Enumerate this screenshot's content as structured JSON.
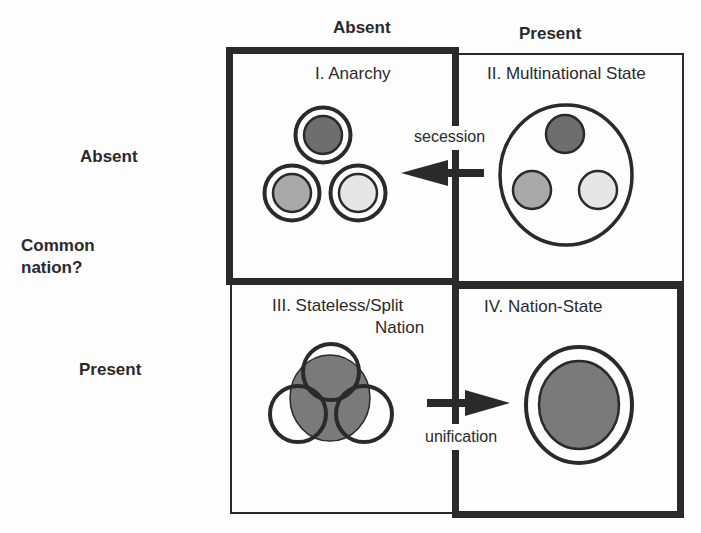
{
  "column_headers": {
    "absent": "Absent",
    "present": "Present"
  },
  "row_headers": {
    "absent": "Absent",
    "present": "Present",
    "axis_title_line1": "Common",
    "axis_title_line2": "nation?"
  },
  "quadrants": [
    {
      "id": "I",
      "title": "I. Anarchy",
      "border": "thick"
    },
    {
      "id": "II",
      "title": "II. Multinational State",
      "border": "thin"
    },
    {
      "id": "III",
      "title_line1": "III. Stateless/Split",
      "title_line2": "Nation",
      "border": "thin"
    },
    {
      "id": "IV",
      "title": "IV. Nation-State",
      "border": "thick"
    }
  ],
  "arrows": {
    "secession": {
      "label": "secession",
      "direction": "left",
      "from": "II",
      "to": "I"
    },
    "unification": {
      "label": "unification",
      "direction": "right",
      "from": "III",
      "to": "IV"
    }
  },
  "colors": {
    "line": "#2a2a2a",
    "fill_dark": "#6e6e6e",
    "fill_mid": "#a9a9a9",
    "fill_light": "#e6e6e6",
    "fill_nation": "#7a7a7a",
    "background": "#fdfdfd"
  }
}
